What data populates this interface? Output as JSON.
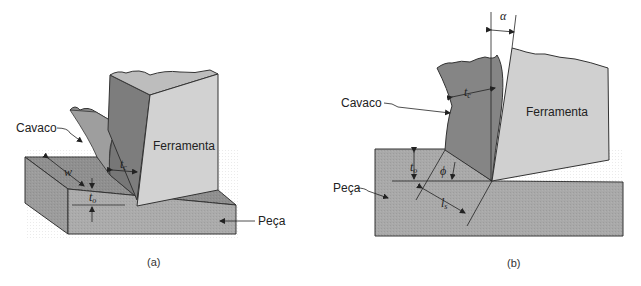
{
  "figure": {
    "panels": [
      {
        "id": "a",
        "caption": "(a)",
        "labels": {
          "chip": "Cavaco",
          "tool": "Ferramenta",
          "workpiece": "Peça",
          "width": "w",
          "chip_thickness": "t",
          "chip_thickness_sub": "c",
          "uncut_thickness": "t",
          "uncut_thickness_sub": "o"
        }
      },
      {
        "id": "b",
        "caption": "(b)",
        "labels": {
          "chip": "Cavaco",
          "tool": "Ferramenta",
          "workpiece": "Peça",
          "rake_angle": "α",
          "shear_angle": "ϕ",
          "chip_thickness": "t",
          "chip_thickness_sub": "c",
          "uncut_thickness": "t",
          "uncut_thickness_sub": "o",
          "shear_length": "l",
          "shear_length_sub": "s"
        }
      }
    ],
    "colors": {
      "workpiece": "#a9a9a9",
      "workpiece_top": "#8f8f8f",
      "chip": "#858585",
      "chip_side": "#9a9a9a",
      "tool_face": "#cfcfcf",
      "tool_side": "#7d7d7d",
      "outline": "#333333"
    }
  }
}
